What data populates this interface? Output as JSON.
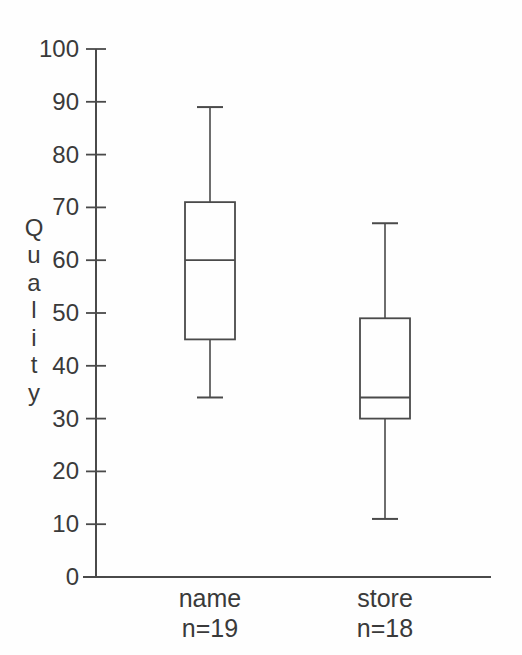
{
  "figure": {
    "background": "#fefefe"
  },
  "chart_data": {
    "type": "boxplot",
    "title": "",
    "xlabel": "",
    "ylabel": "Quality",
    "ylabel_orientation": "vertical-stacked-letters",
    "ylim": [
      0,
      100
    ],
    "ytick_step": 10,
    "yticks": [
      0,
      10,
      20,
      30,
      40,
      50,
      60,
      70,
      80,
      90,
      100
    ],
    "grid": false,
    "legend": false,
    "line_color": "#4a4a4a",
    "text_color": "#3a3a3a",
    "box_fill": "#fefefe",
    "categories": [
      "name",
      "store"
    ],
    "series": [
      {
        "category": "name",
        "count_label": "n=19",
        "n": 19,
        "whisker_min": 34,
        "q1": 45,
        "median": 60,
        "q3": 71,
        "whisker_max": 89
      },
      {
        "category": "store",
        "count_label": "n=18",
        "n": 18,
        "whisker_min": 11,
        "q1": 30,
        "median": 34,
        "q3": 49,
        "whisker_max": 67
      }
    ]
  }
}
